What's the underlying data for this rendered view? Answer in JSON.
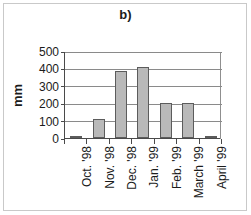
{
  "figure": {
    "panel_label": "b)",
    "frame_color": "#c9c9c9"
  },
  "chart_data": {
    "type": "bar",
    "title": "b)",
    "xlabel": "",
    "ylabel": "mm",
    "categories": [
      "Oct. '98",
      "Nov. '98",
      "Dec. '98",
      "Jan. '99",
      "Feb. '99",
      "March '99",
      "April '99"
    ],
    "values": [
      5,
      110,
      385,
      410,
      200,
      200,
      5
    ],
    "ylim": [
      0,
      500
    ],
    "yticks": [
      0,
      100,
      200,
      300,
      400,
      500
    ],
    "ytick_labels": [
      "0",
      "100",
      "200",
      "300",
      "400",
      "500"
    ],
    "grid": true,
    "grid_axis": "y",
    "legend": false,
    "bar_fill": "#b9b9b9",
    "bar_edge": "#5c5c5c",
    "axis_color": "#4a4a4a",
    "gridline_color": "#8a8a8a",
    "series": [
      {
        "name": "Precipitation",
        "values": [
          5,
          110,
          385,
          410,
          200,
          200,
          5
        ]
      }
    ]
  }
}
